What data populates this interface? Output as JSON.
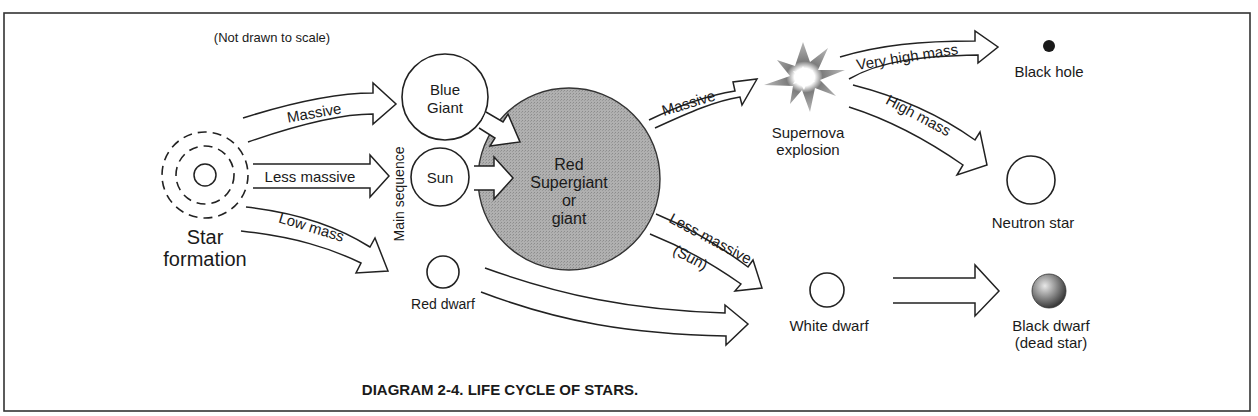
{
  "page": {
    "cutoff_text": "quickly and efficiently ... everything"
  },
  "figure": {
    "note": "(Not drawn to scale)",
    "caption": "DIAGRAM 2-4. LIFE CYCLE OF STARS.",
    "colors": {
      "border": "#333333",
      "supergiant_fill": "#a9a9a9",
      "supernova": "#8a8a8a",
      "ink": "#1a1a1a"
    }
  },
  "nodes": {
    "star_formation": {
      "line1": "Star",
      "line2": "formation"
    },
    "main_sequence": "Main sequence",
    "blue_giant": {
      "line1": "Blue",
      "line2": "Giant"
    },
    "sun": "Sun",
    "red_dwarf": "Red dwarf",
    "red_supergiant": {
      "line1": "Red",
      "line2": "Supergiant",
      "line3": "or",
      "line4": "giant"
    },
    "supernova": {
      "line1": "Supernova",
      "line2": "explosion"
    },
    "black_hole": "Black hole",
    "neutron_star": "Neutron star",
    "white_dwarf": "White dwarf",
    "black_dwarf": {
      "line1": "Black dwarf",
      "line2": "(dead star)"
    }
  },
  "arrows": {
    "formation_to_blue_giant": "Massive",
    "formation_to_sun": "Less massive",
    "formation_to_red_dwarf": "Low mass",
    "supergiant_to_supernova": "Massive",
    "supergiant_to_white_dwarf": {
      "line1": "Less massive",
      "line2": "(Sun)"
    },
    "supernova_to_black_hole": "Very high mass",
    "supernova_to_neutron_star": "High mass"
  }
}
